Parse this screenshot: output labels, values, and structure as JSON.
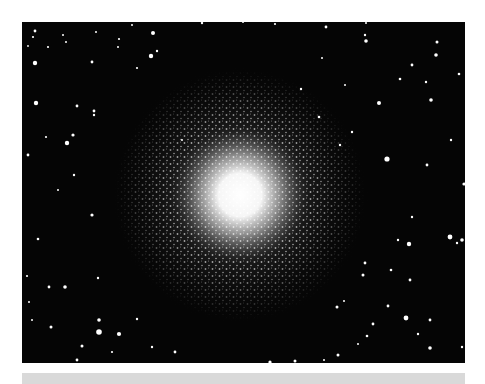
{
  "image": {
    "subject": "globular star cluster",
    "background_color": "#050505",
    "star_color": "#ffffff",
    "core_center": [
      218,
      173
    ],
    "core_radius": 42,
    "halo_radius": 120,
    "frame": {
      "x": 22,
      "y": 22,
      "width": 443,
      "height": 341
    }
  },
  "page": {
    "background_color": "#ffffff",
    "bottom_bar_color": "#d9d9d9"
  },
  "caption": {
    "text": ""
  }
}
